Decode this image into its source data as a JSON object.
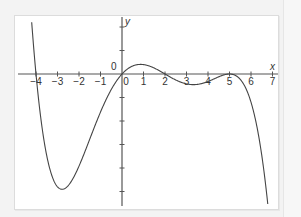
{
  "chart_data": {
    "type": "line",
    "title": "",
    "xlabel": "x",
    "ylabel": "y",
    "origin_label": "0",
    "x_ticks": [
      -4,
      -3,
      -2,
      -1,
      0,
      1,
      2,
      3,
      4,
      5,
      6,
      7
    ],
    "x_tick_labels": [
      "−4",
      "−3",
      "−2",
      "−1",
      "0",
      "1",
      "2",
      "3",
      "4",
      "5",
      "6",
      "7"
    ],
    "y_ticks": [
      2,
      1,
      -1,
      -2,
      -3,
      -4,
      -5
    ],
    "y_tick_labels": [],
    "xlim": [
      -4.5,
      7.4
    ],
    "ylim": [
      -5.6,
      2.4
    ],
    "grid": false,
    "function": "y = -0.005 * x * (x + 4) * (x - 2) * (x - 5)^2",
    "roots": [
      -4,
      0,
      2,
      5
    ],
    "series": [
      {
        "name": "f(x)",
        "x": [
          -4.2,
          -4,
          -3.5,
          -3,
          -2.6,
          -2,
          -1,
          0,
          0.8,
          1,
          2,
          3,
          4,
          5,
          5.5,
          6,
          6.5,
          6.8
        ],
        "values": [
          1.9,
          0,
          -2.4,
          -3.8,
          -4.6,
          -3.9,
          -1.8,
          0,
          0.4,
          0.4,
          0,
          -0.4,
          -0.3,
          0,
          -0.3,
          -1.2,
          -3.5,
          -5.4
        ]
      }
    ],
    "colors": {
      "curve": "#444444",
      "axis": "#555555",
      "background": "#ffffff",
      "frame": "#f3f3f3"
    }
  }
}
